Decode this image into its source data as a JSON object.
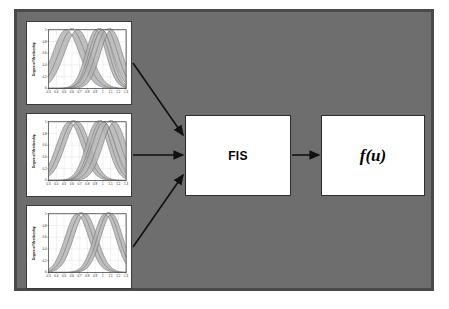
{
  "figure": {
    "kind": "block-diagram",
    "background_color": "#6e6e6e",
    "frame_color": "#4a4a4a",
    "panel_background": "#ffffff"
  },
  "blocks": {
    "fis": {
      "label": "FIS",
      "name": "fuzzy-inference-system"
    },
    "output": {
      "label": "f(u)",
      "name": "output-function"
    }
  },
  "arrows": [
    {
      "name": "arrow-input-1-to-fis",
      "from": "plot-panel-1",
      "to": "fis-box",
      "style": "diagonal-down"
    },
    {
      "name": "arrow-input-2-to-fis",
      "from": "plot-panel-2",
      "to": "fis-box",
      "style": "horizontal"
    },
    {
      "name": "arrow-input-3-to-fis",
      "from": "plot-panel-3",
      "to": "fis-box",
      "style": "diagonal-up"
    },
    {
      "name": "arrow-fis-to-output",
      "from": "fis-box",
      "to": "fu-box",
      "style": "horizontal"
    }
  ],
  "chart_data": [
    {
      "id": "input-1",
      "type": "line",
      "title": "",
      "xlabel": "",
      "ylabel": "Degree of Membership",
      "xlim": [
        0.3,
        1.3
      ],
      "ylim": [
        0,
        1
      ],
      "grid": true,
      "xticks": [
        "0.3",
        "0.4",
        "0.5",
        "0.6",
        "0.7",
        "0.8",
        "0.9",
        "1",
        "1.1",
        "1.2",
        "1.3"
      ],
      "yticks": [
        "0",
        "0.2",
        "0.4",
        "0.6",
        "0.8",
        "1"
      ],
      "annotations": [
        "mf1",
        "mf2",
        "mf3"
      ],
      "series": [
        {
          "name": "mf1",
          "center": 0.6,
          "width": 0.17,
          "band": 0.075,
          "label_x": 0.6
        },
        {
          "name": "mf2",
          "center": 0.95,
          "width": 0.13,
          "band": 0.04,
          "label_x": 0.95
        },
        {
          "name": "mf3",
          "center": 1.05,
          "width": 0.14,
          "band": 0.06,
          "label_x": 1.08
        }
      ]
    },
    {
      "id": "input-2",
      "type": "line",
      "title": "",
      "xlabel": "",
      "ylabel": "Degree of Membership",
      "xlim": [
        0.3,
        1.3
      ],
      "ylim": [
        0,
        1
      ],
      "grid": true,
      "xticks": [
        "0.3",
        "0.4",
        "0.5",
        "0.6",
        "0.7",
        "0.8",
        "0.9",
        "1",
        "1.1",
        "1.2",
        "1.3"
      ],
      "yticks": [
        "0",
        "0.2",
        "0.4",
        "0.6",
        "0.8",
        "1"
      ],
      "annotations": [
        "mf1",
        "mf2",
        "mf3"
      ],
      "series": [
        {
          "name": "mf1",
          "center": 0.62,
          "width": 0.16,
          "band": 0.055,
          "label_x": 0.62
        },
        {
          "name": "mf2",
          "center": 0.97,
          "width": 0.14,
          "band": 0.045,
          "label_x": 0.96
        },
        {
          "name": "mf3",
          "center": 1.08,
          "width": 0.15,
          "band": 0.07,
          "label_x": 1.1
        }
      ]
    },
    {
      "id": "input-3",
      "type": "line",
      "title": "",
      "xlabel": "",
      "ylabel": "Degree of Membership",
      "xlim": [
        0.3,
        1.3
      ],
      "ylim": [
        0,
        1
      ],
      "grid": true,
      "xticks": [
        "0.3",
        "0.4",
        "0.5",
        "0.6",
        "0.7",
        "0.8",
        "0.9",
        "1",
        "1.1",
        "1.2",
        "1.3"
      ],
      "yticks": [
        "0",
        "0.2",
        "0.4",
        "0.6",
        "0.8",
        "1"
      ],
      "annotations": [
        "mf1",
        "mf2"
      ],
      "series": [
        {
          "name": "mf1",
          "center": 0.72,
          "width": 0.15,
          "band": 0.055,
          "label_x": 0.72
        },
        {
          "name": "mf2",
          "center": 1.07,
          "width": 0.14,
          "band": 0.045,
          "label_x": 1.07
        }
      ]
    }
  ]
}
